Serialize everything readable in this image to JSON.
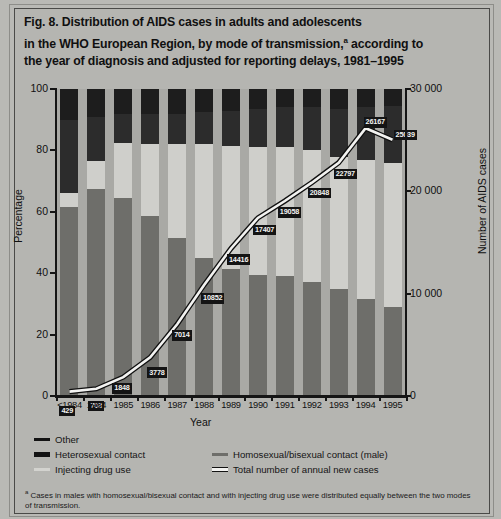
{
  "figure": {
    "title_line1": "Fig. 8. Distribution of AIDS cases in adults and adolescents",
    "title_line2_a": "in the WHO European Region, by mode of transmission,",
    "title_line2_marker": "a",
    "title_line2_b": " according to",
    "title_line3": "the year of diagnosis and adjusted for reporting delays, 1981–1995"
  },
  "axes": {
    "y_left_title": "Percentage",
    "y_left_ticks": [
      "0",
      "20",
      "40",
      "60",
      "80",
      "100"
    ],
    "y_right_title": "Number of AIDS cases",
    "y_right_ticks": [
      "0",
      "10 000",
      "20 000",
      "30 000"
    ],
    "x_title": "Year"
  },
  "legend": {
    "items": [
      {
        "label": "Other",
        "marker": "thin-black-line-marker"
      },
      {
        "label": "Heterosexual contact",
        "marker": "thick-black-line-marker"
      },
      {
        "label": "Injecting drug use",
        "marker": "light-gray-line-marker"
      },
      {
        "label": "Homosexual/bisexual contact (male)",
        "marker": "mid-gray-line-marker"
      },
      {
        "label": "Total number of annual new cases",
        "marker": "white-outlined-line-marker"
      }
    ]
  },
  "footnote": {
    "marker": "a",
    "text": " Cases in males with homosexual/bisexual contact and with injecting drug use were distributed equally between the two modes of transmission."
  },
  "colors": {
    "background": "#b9b9b5",
    "plot_background": "#a9a9a5",
    "other": "#1d1d1d",
    "heterosexual": "#2c2c2c",
    "injecting_drug_use": "#cfcfcb",
    "homosexual_bisexual": "#6e6e6a",
    "total_line": "#f3f3f1",
    "axis": "#151515",
    "label_box": "#141414"
  },
  "chart_data": {
    "type": "bar",
    "xlabel": "Year",
    "ylabel": "Percentage",
    "y2label": "Number of AIDS cases",
    "ylim": [
      0,
      100
    ],
    "y2lim": [
      0,
      30000
    ],
    "yticks": [
      0,
      20,
      40,
      60,
      80,
      100
    ],
    "y2ticks": [
      0,
      10000,
      20000,
      30000
    ],
    "grid": false,
    "legend_position": "below-axes",
    "stacked": true,
    "categories": [
      "<1984",
      "1984",
      "1985",
      "1986",
      "1987",
      "1988",
      "1989",
      "1990",
      "1991",
      "1992",
      "1993",
      "1994",
      "1995"
    ],
    "series": [
      {
        "name": "Homosexual/bisexual contact (male)",
        "color": "#6e6e6a",
        "values": [
          61.5,
          67.5,
          64.5,
          58.5,
          51.5,
          45.0,
          41.5,
          39.5,
          39.0,
          37.0,
          35.0,
          31.5,
          29.0
        ]
      },
      {
        "name": "Injecting drug use",
        "color": "#cfcfcb",
        "values": [
          4.5,
          9.0,
          18.0,
          23.5,
          30.5,
          37.0,
          40.0,
          41.5,
          42.0,
          43.0,
          43.0,
          45.5,
          47.0
        ]
      },
      {
        "name": "Heterosexual contact",
        "color": "#2c2c2c",
        "values": [
          24.0,
          14.5,
          9.5,
          10.0,
          10.0,
          10.5,
          11.5,
          12.5,
          13.0,
          14.0,
          15.5,
          17.0,
          18.5
        ]
      },
      {
        "name": "Other",
        "color": "#1d1d1d",
        "values": [
          10.0,
          9.0,
          8.0,
          8.0,
          8.0,
          7.5,
          7.0,
          6.5,
          6.0,
          6.0,
          6.5,
          6.0,
          5.5
        ]
      }
    ],
    "overlay_line": {
      "name": "Total number of annual new cases",
      "axis": "y2",
      "color": "#f3f3f1",
      "values": [
        429,
        703,
        1848,
        3778,
        7014,
        10852,
        14416,
        17407,
        19058,
        20848,
        22797,
        26167,
        25039
      ],
      "labels": [
        "429",
        "703",
        "1848",
        "3778",
        "7014",
        "10852",
        "14416",
        "17407",
        "19058",
        "20848",
        "22797",
        "26167",
        "25039"
      ]
    }
  }
}
